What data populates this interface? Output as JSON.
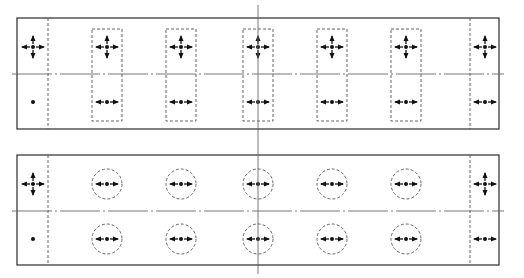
{
  "diagram": {
    "width": 524,
    "height": 278,
    "colors": {
      "background": "#ffffff",
      "line": "#2a2a2a",
      "dashed": "#555555",
      "axis": "#6a6a6a",
      "symbol": "#111111"
    },
    "vertical_axis_x": 258,
    "panels": [
      {
        "id": "top-panel",
        "box": {
          "x1": 17,
          "y1": 18,
          "x2": 499,
          "y2": 129
        },
        "centerline_y": 74,
        "centerline_extent": {
          "x1": 12,
          "x2": 504
        },
        "divider_left_x": 48,
        "divider_right_x": 470,
        "element_shape": "rect",
        "element_size": {
          "w": 30,
          "h": 92
        },
        "element_top_y": 29,
        "elements_x": [
          107,
          181,
          258,
          332,
          406
        ],
        "row_symbols_y": {
          "upper": 47,
          "lower": 102
        },
        "element_symbols": {
          "upper": "cross-arrows",
          "lower": "horizontal-arrows"
        },
        "left_end": {
          "x": 33,
          "upper": "cross-arrows",
          "lower": "dot"
        },
        "right_end": {
          "x": 485,
          "upper": "cross-arrows",
          "lower": "horizontal-arrows"
        }
      },
      {
        "id": "bottom-panel",
        "box": {
          "x1": 17,
          "y1": 155,
          "x2": 499,
          "y2": 265
        },
        "centerline_y": 211,
        "centerline_extent": {
          "x1": 12,
          "x2": 504
        },
        "divider_left_x": 48,
        "divider_right_x": 470,
        "element_shape": "circle",
        "element_radius": 15,
        "elements_x": [
          107,
          181,
          258,
          332,
          406
        ],
        "row_symbols_y": {
          "upper": 184,
          "lower": 239
        },
        "element_symbols": {
          "upper": "horizontal-arrows",
          "lower": "horizontal-arrows"
        },
        "left_end": {
          "x": 33,
          "upper": "cross-arrows",
          "lower": "dot"
        },
        "right_end": {
          "x": 485,
          "upper": "cross-arrows",
          "lower": "horizontal-arrows"
        }
      }
    ],
    "axis_extent": {
      "y1": 5,
      "y2": 274
    }
  }
}
